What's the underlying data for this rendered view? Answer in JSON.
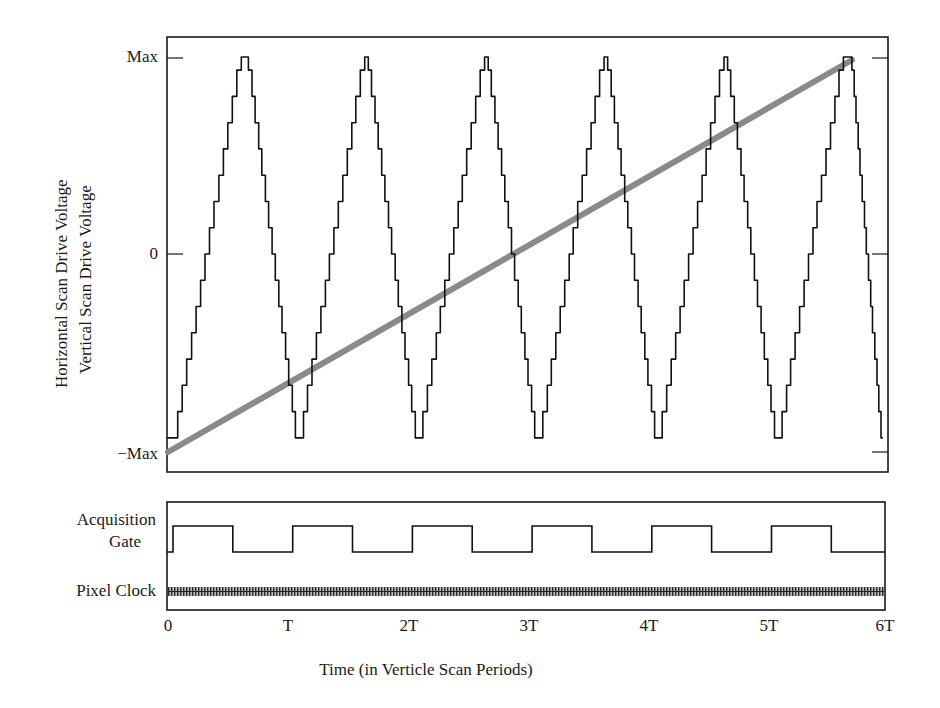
{
  "chart_data": [
    {
      "type": "line",
      "panel": "top",
      "title": "",
      "ylabel_lines": [
        "Horizontal Scan Drive Voltage",
        "Vertical Scan Drive Voltage"
      ],
      "xlabel": "Time (in Verticle Scan Periods)",
      "x_tick_labels": [
        "0",
        "T",
        "2T",
        "3T",
        "4T",
        "5T",
        "6T"
      ],
      "x_ticks": [
        0,
        1,
        2,
        3,
        4,
        5,
        6
      ],
      "y_tick_labels": [
        "Max",
        "0",
        "−Max"
      ],
      "y_ticks": [
        1,
        0,
        -1
      ],
      "xlim": [
        0,
        6
      ],
      "ylim": [
        -1.1,
        1.1
      ],
      "grid": false,
      "legend": "none",
      "series": [
        {
          "name": "Horizontal Scan Drive Voltage",
          "style": "stepped triangle wave, thin black",
          "color": "#111111",
          "x": [
            0.0,
            0.05,
            0.62,
            0.68,
            1.1,
            1.65,
            1.68,
            2.1,
            2.65,
            2.68,
            3.1,
            3.65,
            3.68,
            4.1,
            4.65,
            4.68,
            5.1,
            5.65,
            5.72,
            5.98
          ],
          "values": [
            -1.0,
            -1.0,
            1.0,
            1.0,
            -1.0,
            1.0,
            1.0,
            -1.0,
            1.0,
            1.0,
            -1.0,
            1.0,
            1.0,
            -1.0,
            1.0,
            1.0,
            -1.0,
            1.0,
            1.0,
            -1.0
          ]
        },
        {
          "name": "Vertical Scan Drive Voltage",
          "style": "linear ramp, thick gray",
          "color": "#8a8a8a",
          "x": [
            0.0,
            5.7
          ],
          "values": [
            -1.0,
            1.0
          ]
        }
      ]
    },
    {
      "type": "line",
      "panel": "bottom",
      "title": "",
      "xlim": [
        0,
        6
      ],
      "x_tick_labels": [
        "0",
        "T",
        "2T",
        "3T",
        "4T",
        "5T",
        "6T"
      ],
      "signal_labels": [
        "Acquisition\nGate",
        "Pixel Clock"
      ],
      "series": [
        {
          "name": "Acquisition Gate",
          "style": "square wave",
          "color": "#111111",
          "high_intervals": [
            [
              0.05,
              0.55
            ],
            [
              1.05,
              1.55
            ],
            [
              2.05,
              2.55
            ],
            [
              3.05,
              3.55
            ],
            [
              4.05,
              4.55
            ],
            [
              5.05,
              5.55
            ]
          ],
          "values_legend": {
            "high": 1,
            "low": 0
          }
        },
        {
          "name": "Pixel Clock",
          "style": "dense high-frequency clock (rendered as hatched band)",
          "color": "#333333"
        }
      ]
    }
  ],
  "labels": {
    "y_max": "Max",
    "y_zero": "0",
    "y_min": "−Max",
    "ylabel_horizontal": "Horizontal Scan Drive Voltage",
    "ylabel_vertical": "Vertical Scan Drive Voltage",
    "acq_gate_line1": "Acquisition",
    "acq_gate_line2": "Gate",
    "pixel_clock": "Pixel Clock",
    "xlabel": "Time (in Verticle Scan Periods)",
    "xticks": [
      "0",
      "T",
      "2T",
      "3T",
      "4T",
      "5T",
      "6T"
    ]
  },
  "colors": {
    "axes": "#1a1a1a",
    "horizontal_scan": "#111111",
    "vertical_scan": "#8a8a8a",
    "pixel_clock": "#333333"
  }
}
